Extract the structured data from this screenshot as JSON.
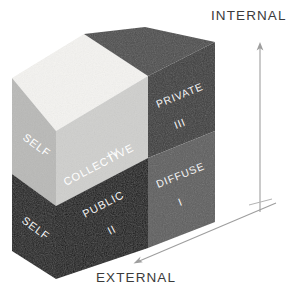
{
  "diagram": {
    "axes": {
      "vertical": {
        "label": "INTERNAL",
        "direction": "up",
        "color": "#9a9a9a"
      },
      "horizontal": {
        "label": "EXTERNAL",
        "direction": "down-left",
        "color": "#9a9a9a"
      }
    },
    "faces": {
      "top": {
        "name": "top-face",
        "left_color": "#f4f3f0",
        "right_color": "#4d4d4d"
      },
      "left": {
        "name": "left-face",
        "upper": {
          "label": "SELF",
          "fill": "#b9b9b7",
          "text_color": "#ffffff"
        },
        "lower": {
          "label": "SELF",
          "fill": "#1b1b1b",
          "text_color": "#f2f2f2"
        }
      },
      "front": {
        "name": "front-face",
        "upper": {
          "label": "COLLECTIVE",
          "numeral": "IV",
          "fill": "#cfcfcd",
          "text_color": "#ffffff"
        },
        "lower": {
          "label": "PUBLIC",
          "numeral": "II",
          "fill": "#161616",
          "text_color": "#f2f2f2"
        }
      },
      "right": {
        "name": "right-face",
        "upper": {
          "label": "PRIVATE",
          "numeral": "III",
          "fill": "#3c3c3c",
          "text_color": "#f4f4f4"
        },
        "lower": {
          "label": "DIFFUSE",
          "numeral": "I",
          "fill": "#5e5e5e",
          "text_color": "#f4f4f4"
        }
      }
    }
  }
}
